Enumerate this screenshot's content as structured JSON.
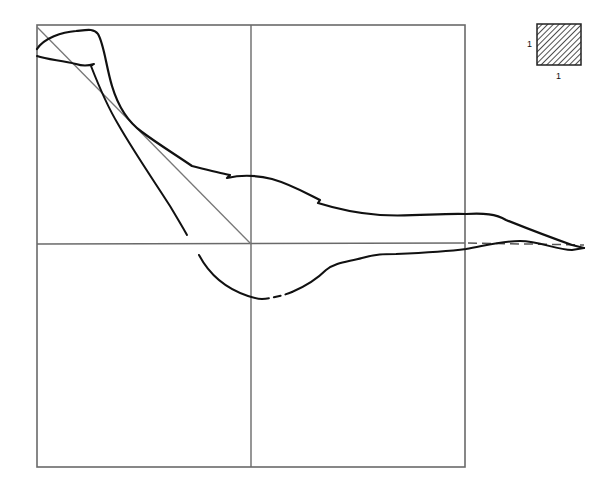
{
  "diagram": {
    "type": "phase-plane trajectory plot",
    "frame": {
      "box": {
        "x1": 37,
        "y1": 25,
        "x2": 465,
        "y2": 467
      },
      "center": {
        "x": 251,
        "y": 244
      },
      "line_color": "#6a6a6a",
      "grid_color": "#6a6a6a"
    },
    "diagonal": {
      "from": {
        "x": 37,
        "y": 27
      },
      "to": {
        "x": 251,
        "y": 244
      },
      "color": "#777777"
    },
    "scale_key": {
      "x": 537,
      "y": 24,
      "width": 44,
      "height": 41,
      "fill_pattern": "diagonal-hatch",
      "side_label": "1",
      "bottom_label": "1"
    },
    "curves": {
      "upper_loop_color": "#111111",
      "lower_loop_color": "#111111",
      "dashed_reference_color": "#555555"
    }
  }
}
